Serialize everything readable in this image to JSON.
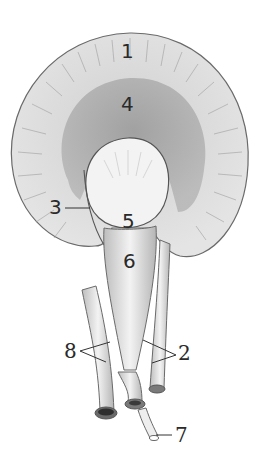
{
  "figure": {
    "colors": {
      "cortex": "#dcdcdc",
      "medulla": "#a9a9a9",
      "pelvis": "#f1f1f1",
      "outline": "#6a6a6a",
      "vessels": "#e6e6e6",
      "label": "#2a2a2a"
    }
  },
  "labels": [
    {
      "id": "1",
      "text": "1"
    },
    {
      "id": "2",
      "text": "2"
    },
    {
      "id": "3",
      "text": "3"
    },
    {
      "id": "4",
      "text": "4"
    },
    {
      "id": "5",
      "text": "5"
    },
    {
      "id": "6",
      "text": "6"
    },
    {
      "id": "7",
      "text": "7"
    },
    {
      "id": "8",
      "text": "8"
    }
  ]
}
